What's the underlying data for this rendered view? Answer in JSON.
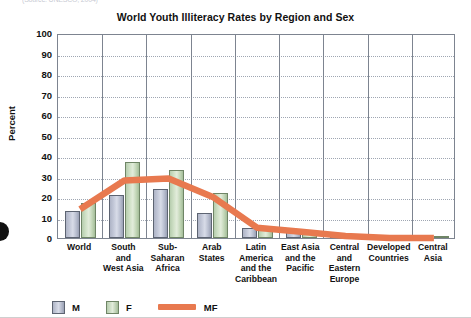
{
  "source_note": "(Source: UNESCO, 2004)",
  "chart_data": {
    "type": "bar",
    "title": "World Youth Illiteracy Rates by Region and Sex",
    "xlabel": "",
    "ylabel": "Percent",
    "ylim": [
      0,
      100
    ],
    "ytick_step": 10,
    "ytick_labels": [
      "0",
      "10",
      "20",
      "30",
      "40",
      "50",
      "60",
      "70",
      "80",
      "90",
      "100"
    ],
    "grid": true,
    "grid_style": "dotted-horizontal",
    "legend_position": "bottom-left",
    "categories": [
      "World",
      "South and West Asia",
      "Sub-Saharan Africa",
      "Arab States",
      "Latin America and the Caribbean",
      "East Asia and the Pacific",
      "Central and Eastern Europe",
      "Developed Countries",
      "Central Asia"
    ],
    "category_lines": [
      [
        "World"
      ],
      [
        "South",
        "and",
        "West Asia"
      ],
      [
        "Sub-",
        "Saharan",
        "Africa"
      ],
      [
        "Arab",
        "States"
      ],
      [
        "Latin",
        "America",
        "and the",
        "Caribbean"
      ],
      [
        "East Asia",
        "and the",
        "Pacific"
      ],
      [
        "Central",
        "and",
        "Eastern",
        "Europe"
      ],
      [
        "Developed",
        "Countries"
      ],
      [
        "Central",
        "Asia"
      ]
    ],
    "series": [
      {
        "name": "M",
        "type": "bar",
        "color": "#c3c8d8",
        "values": [
          13,
          21,
          24,
          12,
          5,
          3,
          1,
          1,
          1
        ]
      },
      {
        "name": "F",
        "type": "bar",
        "color": "#cfe0c6",
        "values": [
          17,
          37,
          33,
          22,
          5,
          3,
          1,
          1,
          1
        ]
      },
      {
        "name": "MF",
        "type": "line",
        "color": "#e8794f",
        "values": [
          15,
          29,
          30,
          21,
          6,
          4,
          2,
          1,
          1
        ]
      }
    ]
  },
  "legend": {
    "items": [
      {
        "label": "M",
        "icon": "square-swatch-blue"
      },
      {
        "label": "F",
        "icon": "square-swatch-green"
      },
      {
        "label": "MF",
        "icon": "line-swatch-orange"
      }
    ]
  }
}
